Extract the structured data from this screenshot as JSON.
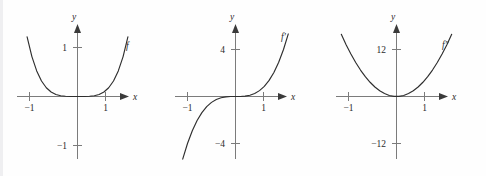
{
  "figure": {
    "background_color": "#fefefe",
    "axis_color": "#7b7b7b",
    "curve_color": "#2e2e2e",
    "text_color": "#2b2b2b"
  },
  "chart_data": [
    {
      "type": "line",
      "title": "",
      "xlabel": "x",
      "ylabel": "y",
      "curve_label": "f",
      "function": "x^4",
      "xlim": [
        -1.22,
        1.22
      ],
      "ylim": [
        -1.45,
        1.45
      ],
      "grid": false,
      "legend": "none",
      "x_ticks": [
        -1,
        1
      ],
      "x_tick_labels": [
        "−1",
        "1"
      ],
      "y_ticks": [
        -1,
        1
      ],
      "y_tick_labels": [
        "−1",
        "1"
      ],
      "x": [
        -1.15,
        -1.05,
        -0.95,
        -0.85,
        -0.75,
        -0.65,
        -0.55,
        -0.45,
        -0.35,
        -0.25,
        -0.15,
        -0.05,
        0.05,
        0.15,
        0.25,
        0.35,
        0.45,
        0.55,
        0.65,
        0.75,
        0.85,
        0.95,
        1.05,
        1.15
      ],
      "values": [
        1.749,
        1.216,
        0.815,
        0.522,
        0.316,
        0.179,
        0.092,
        0.041,
        0.015,
        0.004,
        0.001,
        0.0,
        0.0,
        0.001,
        0.004,
        0.015,
        0.041,
        0.092,
        0.179,
        0.316,
        0.522,
        0.815,
        1.216,
        1.749
      ]
    },
    {
      "type": "line",
      "title": "",
      "xlabel": "x",
      "ylabel": "y",
      "curve_label": "f′",
      "function": "4x^3",
      "xlim": [
        -1.22,
        1.22
      ],
      "ylim": [
        -5.8,
        5.8
      ],
      "grid": false,
      "legend": "none",
      "x_ticks": [
        -1,
        1
      ],
      "x_tick_labels": [
        "−1",
        "1"
      ],
      "y_ticks": [
        -4,
        4
      ],
      "y_tick_labels": [
        "−4",
        "4"
      ],
      "x": [
        -1.1,
        -1.0,
        -0.9,
        -0.8,
        -0.7,
        -0.6,
        -0.5,
        -0.4,
        -0.3,
        -0.2,
        -0.1,
        0.0,
        0.1,
        0.2,
        0.3,
        0.4,
        0.5,
        0.6,
        0.7,
        0.8,
        0.9,
        1.0,
        1.1
      ],
      "values": [
        -5.324,
        -4.0,
        -2.916,
        -2.048,
        -1.372,
        -0.864,
        -0.5,
        -0.256,
        -0.108,
        -0.032,
        -0.004,
        0.0,
        0.004,
        0.032,
        0.108,
        0.256,
        0.5,
        0.864,
        1.372,
        2.048,
        2.916,
        4.0,
        5.324
      ]
    },
    {
      "type": "line",
      "title": "",
      "xlabel": "x",
      "ylabel": "y",
      "curve_label": "f″",
      "function": "12x^2",
      "xlim": [
        -1.22,
        1.22
      ],
      "ylim": [
        -17.5,
        17.5
      ],
      "grid": false,
      "legend": "none",
      "x_ticks": [
        -1,
        1
      ],
      "x_tick_labels": [
        "−1",
        "1"
      ],
      "y_ticks": [
        -12,
        12
      ],
      "y_tick_labels": [
        "−12",
        "12"
      ],
      "x": [
        -1.15,
        -1.05,
        -0.95,
        -0.85,
        -0.75,
        -0.65,
        -0.55,
        -0.45,
        -0.35,
        -0.25,
        -0.15,
        -0.05,
        0.05,
        0.15,
        0.25,
        0.35,
        0.45,
        0.55,
        0.65,
        0.75,
        0.85,
        0.95,
        1.05,
        1.15
      ],
      "values": [
        15.87,
        13.23,
        10.83,
        8.67,
        6.75,
        5.07,
        3.63,
        2.43,
        1.47,
        0.75,
        0.27,
        0.03,
        0.03,
        0.27,
        0.75,
        1.47,
        2.43,
        3.63,
        5.07,
        6.75,
        8.67,
        10.83,
        13.23,
        15.87
      ]
    }
  ],
  "panels": [
    {
      "name": "panel-f",
      "curve_label": "f",
      "x_axis_label": "x",
      "y_axis_label": "y",
      "x_neg_label": "−1",
      "x_pos_label": "1",
      "y_neg_label": "−1",
      "y_pos_label": "1"
    },
    {
      "name": "panel-f-prime",
      "curve_label": "f′",
      "x_axis_label": "x",
      "y_axis_label": "y",
      "x_neg_label": "−1",
      "x_pos_label": "1",
      "y_neg_label": "−4",
      "y_pos_label": "4"
    },
    {
      "name": "panel-f-double-prime",
      "curve_label": "f″",
      "x_axis_label": "x",
      "y_axis_label": "y",
      "x_neg_label": "−12",
      "x_pos_label": "1",
      "y_neg_label": "−12",
      "y_pos_label": "12"
    }
  ]
}
